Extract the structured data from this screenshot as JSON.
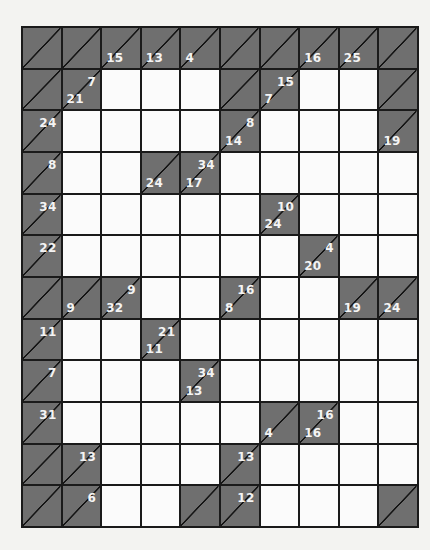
{
  "puzzle": {
    "type": "kakuro",
    "rows": 12,
    "cols": 10,
    "colors": {
      "clue_cell": "#6f6f6f",
      "empty_cell": "#fbfbfb",
      "grid_line": "#1a1a1a",
      "clue_text": "#f4f4f4"
    },
    "grid": [
      [
        {
          "t": "B"
        },
        {
          "t": "B"
        },
        {
          "t": "C",
          "d": "15"
        },
        {
          "t": "C",
          "d": "13"
        },
        {
          "t": "C",
          "d": "4"
        },
        {
          "t": "B"
        },
        {
          "t": "B"
        },
        {
          "t": "C",
          "d": "16"
        },
        {
          "t": "C",
          "d": "25"
        },
        {
          "t": "B"
        }
      ],
      [
        {
          "t": "B"
        },
        {
          "t": "C",
          "d": "21",
          "a": "7"
        },
        {
          "t": "W"
        },
        {
          "t": "W"
        },
        {
          "t": "W"
        },
        {
          "t": "B"
        },
        {
          "t": "C",
          "d": "7",
          "a": "15"
        },
        {
          "t": "W"
        },
        {
          "t": "W"
        },
        {
          "t": "B"
        }
      ],
      [
        {
          "t": "C",
          "a": "24"
        },
        {
          "t": "W"
        },
        {
          "t": "W"
        },
        {
          "t": "W"
        },
        {
          "t": "W"
        },
        {
          "t": "C",
          "d": "14",
          "a": "8"
        },
        {
          "t": "W"
        },
        {
          "t": "W"
        },
        {
          "t": "W"
        },
        {
          "t": "C",
          "d": "19"
        }
      ],
      [
        {
          "t": "C",
          "a": "8"
        },
        {
          "t": "W"
        },
        {
          "t": "W"
        },
        {
          "t": "C",
          "d": "24"
        },
        {
          "t": "C",
          "d": "17",
          "a": "34"
        },
        {
          "t": "W"
        },
        {
          "t": "W"
        },
        {
          "t": "W"
        },
        {
          "t": "W"
        },
        {
          "t": "W"
        }
      ],
      [
        {
          "t": "C",
          "a": "34"
        },
        {
          "t": "W"
        },
        {
          "t": "W"
        },
        {
          "t": "W"
        },
        {
          "t": "W"
        },
        {
          "t": "W"
        },
        {
          "t": "C",
          "d": "24",
          "a": "10"
        },
        {
          "t": "W"
        },
        {
          "t": "W"
        },
        {
          "t": "W"
        }
      ],
      [
        {
          "t": "C",
          "a": "22"
        },
        {
          "t": "W"
        },
        {
          "t": "W"
        },
        {
          "t": "W"
        },
        {
          "t": "W"
        },
        {
          "t": "W"
        },
        {
          "t": "W"
        },
        {
          "t": "C",
          "d": "20",
          "a": "4"
        },
        {
          "t": "W"
        },
        {
          "t": "W"
        }
      ],
      [
        {
          "t": "B"
        },
        {
          "t": "C",
          "d": "9"
        },
        {
          "t": "C",
          "d": "32",
          "a": "9"
        },
        {
          "t": "W"
        },
        {
          "t": "W"
        },
        {
          "t": "C",
          "d": "8",
          "a": "16"
        },
        {
          "t": "W"
        },
        {
          "t": "W"
        },
        {
          "t": "C",
          "d": "19"
        },
        {
          "t": "C",
          "d": "24"
        }
      ],
      [
        {
          "t": "C",
          "a": "11"
        },
        {
          "t": "W"
        },
        {
          "t": "W"
        },
        {
          "t": "C",
          "d": "11",
          "a": "21"
        },
        {
          "t": "W"
        },
        {
          "t": "W"
        },
        {
          "t": "W"
        },
        {
          "t": "W"
        },
        {
          "t": "W"
        },
        {
          "t": "W"
        }
      ],
      [
        {
          "t": "C",
          "a": "7"
        },
        {
          "t": "W"
        },
        {
          "t": "W"
        },
        {
          "t": "W"
        },
        {
          "t": "C",
          "d": "13",
          "a": "34"
        },
        {
          "t": "W"
        },
        {
          "t": "W"
        },
        {
          "t": "W"
        },
        {
          "t": "W"
        },
        {
          "t": "W"
        }
      ],
      [
        {
          "t": "C",
          "a": "31"
        },
        {
          "t": "W"
        },
        {
          "t": "W"
        },
        {
          "t": "W"
        },
        {
          "t": "W"
        },
        {
          "t": "W"
        },
        {
          "t": "C",
          "d": "4"
        },
        {
          "t": "C",
          "d": "16",
          "a": "16"
        },
        {
          "t": "W"
        },
        {
          "t": "W"
        }
      ],
      [
        {
          "t": "B"
        },
        {
          "t": "C",
          "a": "13"
        },
        {
          "t": "W"
        },
        {
          "t": "W"
        },
        {
          "t": "W"
        },
        {
          "t": "C",
          "a": "13"
        },
        {
          "t": "W"
        },
        {
          "t": "W"
        },
        {
          "t": "W"
        },
        {
          "t": "W"
        }
      ],
      [
        {
          "t": "B"
        },
        {
          "t": "C",
          "a": "6"
        },
        {
          "t": "W"
        },
        {
          "t": "W"
        },
        {
          "t": "B"
        },
        {
          "t": "C",
          "a": "12"
        },
        {
          "t": "W"
        },
        {
          "t": "W"
        },
        {
          "t": "W"
        },
        {
          "t": "B"
        }
      ]
    ]
  }
}
